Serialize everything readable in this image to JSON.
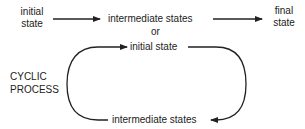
{
  "linear_process": {
    "start_label": [
      "initial",
      "state"
    ],
    "middle_label": "intermediate states",
    "end_label": [
      "final",
      "state"
    ]
  },
  "separator": "or",
  "cyclic_process": {
    "title": [
      "CYCLIC",
      "PROCESS"
    ],
    "top_label": "initial state",
    "bottom_label": "intermediate states"
  },
  "colors": {
    "ink": "#222222",
    "background": "#ffffff"
  }
}
